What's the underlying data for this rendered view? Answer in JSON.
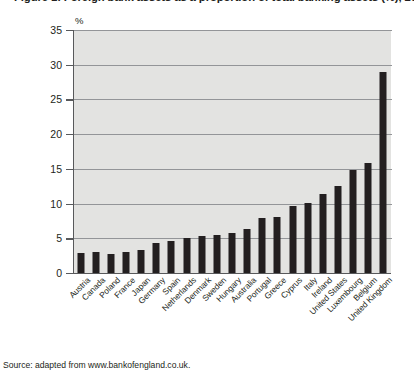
{
  "chart_data": {
    "type": "bar",
    "title": "Figure 1: Foreign bank assets as a proportion of total banking assets (%), 2009",
    "xlabel": "",
    "ylabel": "",
    "y_unit": "%",
    "ylim": [
      0,
      35
    ],
    "yticks": [
      0,
      5,
      10,
      15,
      20,
      25,
      30,
      35
    ],
    "ytick_labels": [
      "0",
      "5",
      "10",
      "15",
      "20",
      "25",
      "30",
      "35"
    ],
    "grid": true,
    "legend": "none",
    "bar_color": "#231f20",
    "plot_background": "#e3e3e1",
    "categories": [
      "Austria",
      "Canada",
      "Poland",
      "France",
      "Japan",
      "Germany",
      "Spain",
      "Netherlands",
      "Denmark",
      "Sweden",
      "Hungary",
      "Australia",
      "Portugal",
      "Greece",
      "Cyprus",
      "Italy",
      "Ireland",
      "United States",
      "Luxembourg",
      "Belgium",
      "United Kingdom"
    ],
    "values": [
      2.9,
      3.0,
      2.8,
      3.0,
      3.3,
      4.3,
      4.6,
      5.1,
      5.3,
      5.5,
      5.7,
      6.3,
      7.9,
      8.1,
      9.6,
      10.1,
      11.4,
      12.6,
      14.8,
      15.8,
      29.0
    ],
    "source": "Source: adapted from www.bankofengland.co.uk."
  }
}
